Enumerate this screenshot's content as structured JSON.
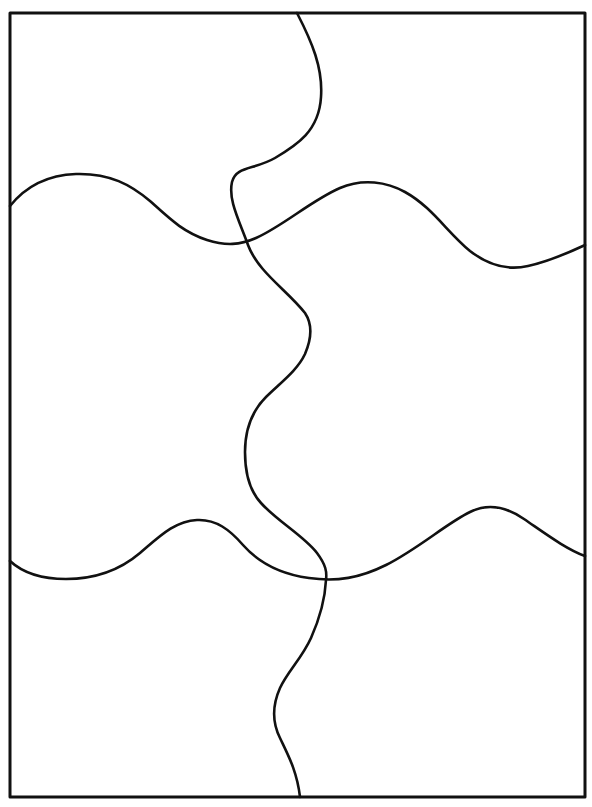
{
  "page": {
    "background_color": "#ffffff",
    "width": 592,
    "height": 807
  },
  "drawing": {
    "type": "line-art",
    "subject": "six-piece blank jigsaw puzzle outline",
    "stroke_color": "#111111",
    "border_stroke_width": 3,
    "cut_stroke_width": 2.6,
    "piece_count": 6,
    "grid": {
      "columns": 2,
      "rows": 3
    },
    "frame": {
      "left": 10,
      "top": 13,
      "right": 585,
      "bottom": 797,
      "path": "M 10 13 L 585 13 L 585 797 L 10 797 Z"
    },
    "cuts": [
      {
        "name": "vertical-cut",
        "orientation": "vertical",
        "from": "top-border",
        "to": "bottom-border",
        "path": "M 297 13 C 312 42 323 68 321 97 C 319 131 297 145 275 158 C 254 170 236 166 232 182 C 228 200 239 220 248 245 C 258 272 288 291 305 313 C 313 325 311 340 305 354 C 297 371 280 383 266 397 C 252 411 245 430 245 452 C 245 471 248 489 261 503 C 277 521 304 536 317 553 C 326 565 327 572 326 580 C 325 600 319 620 311 638 C 302 658 288 671 280 688 C 272 706 272 722 280 738 C 288 755 297 771 300 797"
      },
      {
        "name": "upper-horizontal-cut",
        "orientation": "horizontal",
        "from": "left-border",
        "to": "right-border",
        "path": "M 10 206 C 26 186 48 175 76 174 C 110 173 131 185 150 201 C 170 219 183 232 207 240 C 226 246 240 245 256 238 C 283 226 312 200 340 188 C 363 178 387 182 405 192 C 432 207 447 232 470 251 C 488 265 506 271 528 266 C 551 261 570 252 585 245"
      },
      {
        "name": "lower-horizontal-cut",
        "orientation": "horizontal",
        "from": "left-border",
        "to": "right-border",
        "path": "M 10 561 C 24 574 42 579 66 579 C 95 579 120 570 140 553 C 160 536 175 521 197 520 C 216 519 230 530 243 545 C 258 562 280 574 309 578 C 337 582 360 578 386 565 C 418 549 447 523 470 512 C 490 502 508 508 524 519 C 546 534 566 549 585 556"
      }
    ]
  }
}
